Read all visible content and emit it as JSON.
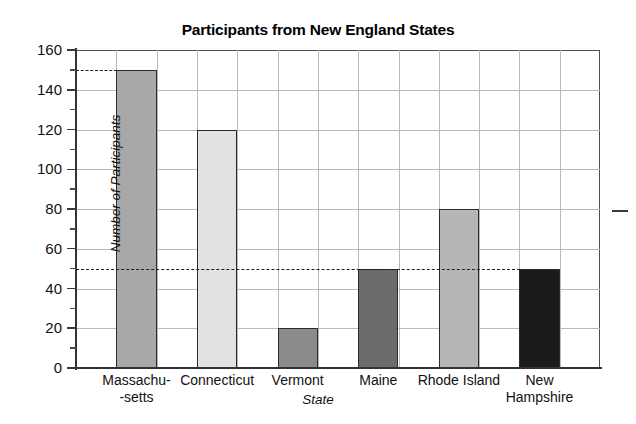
{
  "figure": {
    "scan_artifact_top": ". . .",
    "right_margin_mark": "stray-dash"
  },
  "chart_data": {
    "type": "bar",
    "title": "Participants from New England States",
    "xlabel": "State",
    "ylabel": "Number of Participants",
    "categories": [
      "Massachu-\n-setts",
      "Connecticut",
      "Vermont",
      "Maine",
      "Rhode Island",
      "New\nHampshire"
    ],
    "values": [
      150,
      120,
      20,
      50,
      80,
      50
    ],
    "bar_colors": [
      "#a8a8a8",
      "#e2e2e2",
      "#8b8b8b",
      "#6b6b6b",
      "#b6b6b6",
      "#1b1b1b"
    ],
    "ylim": [
      0,
      160
    ],
    "ytick_values": [
      0,
      20,
      40,
      60,
      80,
      100,
      120,
      140,
      160
    ],
    "yticks": [
      "0",
      "20",
      "40",
      "60",
      "80",
      "100",
      "120",
      "140",
      "160"
    ],
    "yminor_values": [
      10,
      30,
      50,
      70,
      90,
      110,
      130,
      150
    ],
    "grid": true,
    "legend": "none",
    "annotations": [
      {
        "label": "reference-line-150",
        "value": 150,
        "style": "dashed",
        "span": "axis-to-first-bar"
      },
      {
        "label": "reference-line-50",
        "value": 50,
        "style": "dashed",
        "span": "full-width"
      }
    ]
  }
}
